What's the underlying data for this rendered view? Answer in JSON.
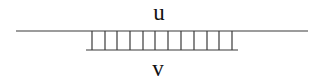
{
  "diagram": {
    "type": "ladder",
    "top_strand": {
      "label": "u",
      "x1": 16,
      "x2": 308,
      "y": 31
    },
    "bottom_strand": {
      "label": "v",
      "x1": 86,
      "x2": 238,
      "y": 50
    },
    "rungs": {
      "count": 12,
      "x_positions": [
        92,
        105,
        117,
        130,
        143,
        155,
        168,
        181,
        194,
        207,
        219,
        232
      ],
      "y_top": 31,
      "y_bottom": 50
    },
    "stroke_color": "#3a3a3a",
    "label_color": "#111111"
  }
}
